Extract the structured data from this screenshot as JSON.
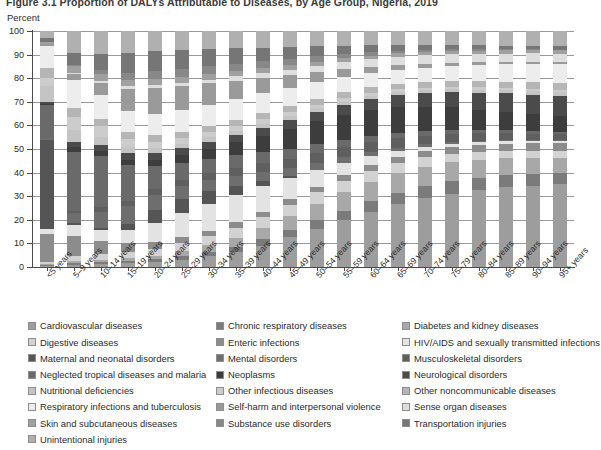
{
  "figure": {
    "title": "Figure 3.1  Proportion of DALYs Attributable to Diseases, by Age Group, Nigeria, 2019",
    "y_unit": "Percent"
  },
  "chart_data": {
    "type": "bar",
    "stacked": true,
    "title": "Figure 3.1  Proportion of DALYs Attributable to Diseases, by Age Group, Nigeria, 2019",
    "xlabel": "",
    "ylabel": "Percent",
    "ylim": [
      0,
      100
    ],
    "yticks": [
      0,
      10,
      20,
      30,
      40,
      50,
      60,
      70,
      80,
      90,
      100
    ],
    "grid": true,
    "legend_position": "bottom",
    "categories": [
      "<5 years",
      "5–9 years",
      "10–14 years",
      "15–19 years",
      "20–24 years",
      "25–29 years",
      "30–34 years",
      "35–39 years",
      "40–44 years",
      "45–49 years",
      "50–54 years",
      "55–59 years",
      "60–64 years",
      "65–69 years",
      "70–74 years",
      "75–79 years",
      "80–84 years",
      "85–89 years",
      "90–94 years",
      "95+ years"
    ],
    "series": [
      {
        "name": "Cardiovascular diseases",
        "color": "#9d9d9d",
        "values": [
          0.6,
          0.8,
          1.0,
          1.3,
          1.8,
          2.6,
          3.8,
          5.4,
          7.6,
          10.5,
          13.8,
          17.4,
          21.0,
          24.5,
          27.5,
          30.0,
          32.0,
          33.5,
          34.5,
          35.0
        ]
      },
      {
        "name": "Chronic respiratory diseases",
        "color": "#7b7b7b",
        "values": [
          0.4,
          0.7,
          0.8,
          0.9,
          1.0,
          1.2,
          1.5,
          1.8,
          2.2,
          2.6,
          3.1,
          3.6,
          4.1,
          4.5,
          4.8,
          5.0,
          5.1,
          5.1,
          5.0,
          4.9
        ]
      },
      {
        "name": "Diabetes and kidney diseases",
        "color": "#a8a8a8",
        "values": [
          0.3,
          0.5,
          0.7,
          0.9,
          1.2,
          1.7,
          2.3,
          3.1,
          4.0,
          5.0,
          6.0,
          6.8,
          7.4,
          7.8,
          7.9,
          7.8,
          7.5,
          7.1,
          6.8,
          6.5
        ]
      },
      {
        "name": "Digestive diseases",
        "color": "#d2d2d2",
        "values": [
          1.0,
          1.6,
          1.9,
          2.1,
          2.4,
          2.8,
          3.2,
          3.6,
          3.9,
          4.1,
          4.2,
          4.2,
          4.1,
          3.9,
          3.7,
          3.5,
          3.3,
          3.1,
          3.0,
          2.9
        ]
      },
      {
        "name": "Enteric infections",
        "color": "#8c8c8c",
        "values": [
          11.5,
          7.0,
          4.5,
          3.0,
          2.4,
          2.1,
          2.0,
          1.9,
          1.9,
          1.9,
          2.0,
          2.1,
          2.2,
          2.3,
          2.4,
          2.6,
          2.8,
          3.0,
          3.1,
          3.2
        ]
      },
      {
        "name": "HIV/AIDS and sexually transmitted infections",
        "color": "#e3e3e3",
        "values": [
          2.2,
          3.5,
          3.8,
          4.5,
          6.5,
          8.5,
          9.5,
          9.8,
          9.0,
          7.5,
          6.0,
          4.6,
          3.4,
          2.5,
          1.9,
          1.5,
          1.2,
          1.0,
          0.9,
          0.8
        ]
      },
      {
        "name": "Maternal and neonatal disorders",
        "color": "#555555",
        "values": [
          38.0,
          1.0,
          0.6,
          2.0,
          4.5,
          5.0,
          4.4,
          3.2,
          1.8,
          0.7,
          0.2,
          0.1,
          0.0,
          0.0,
          0.0,
          0.0,
          0.0,
          0.0,
          0.0,
          0.0
        ]
      },
      {
        "name": "Mental disorders",
        "color": "#6e6e6e",
        "values": [
          0.5,
          3.2,
          5.5,
          6.0,
          5.2,
          4.5,
          4.0,
          3.6,
          3.2,
          2.8,
          2.4,
          2.0,
          1.6,
          1.3,
          1.0,
          0.8,
          0.7,
          0.6,
          0.5,
          0.5
        ]
      },
      {
        "name": "Musculoskeletal disorders",
        "color": "#5f5f5f",
        "values": [
          0.2,
          0.8,
          1.4,
          1.8,
          2.0,
          2.2,
          2.5,
          2.8,
          3.1,
          3.4,
          3.6,
          3.7,
          3.7,
          3.6,
          3.4,
          3.2,
          3.0,
          2.8,
          2.6,
          2.5
        ]
      },
      {
        "name": "Neglected tropical diseases and malaria",
        "color": "#6a6a6a",
        "values": [
          14.0,
          20.0,
          17.5,
          12.0,
          8.0,
          6.0,
          5.0,
          4.4,
          4.0,
          3.6,
          3.2,
          2.8,
          2.4,
          2.1,
          1.8,
          1.6,
          1.4,
          1.3,
          1.2,
          1.1
        ]
      },
      {
        "name": "Neoplasms",
        "color": "#3d3d3d",
        "values": [
          0.6,
          1.6,
          1.8,
          1.9,
          2.2,
          2.8,
          3.6,
          4.6,
          5.8,
          7.0,
          8.2,
          9.2,
          9.8,
          10.0,
          9.8,
          9.2,
          8.4,
          7.6,
          7.0,
          6.5
        ]
      },
      {
        "name": "Neurological disorders",
        "color": "#4b4b4b",
        "values": [
          0.8,
          1.6,
          2.0,
          2.2,
          2.3,
          2.4,
          2.5,
          2.7,
          2.9,
          3.2,
          3.5,
          3.9,
          4.3,
          4.8,
          5.4,
          6.2,
          7.0,
          7.8,
          8.4,
          8.8
        ]
      },
      {
        "name": "Nutritional deficiencies",
        "color": "#c4c4c4",
        "values": [
          6.5,
          4.0,
          2.6,
          2.0,
          1.8,
          1.6,
          1.5,
          1.4,
          1.3,
          1.2,
          1.2,
          1.1,
          1.1,
          1.1,
          1.1,
          1.2,
          1.3,
          1.4,
          1.5,
          1.6
        ]
      },
      {
        "name": "Other infectious diseases",
        "color": "#cccccc",
        "values": [
          3.5,
          4.5,
          3.6,
          2.8,
          2.3,
          2.0,
          1.8,
          1.7,
          1.6,
          1.5,
          1.4,
          1.3,
          1.2,
          1.2,
          1.1,
          1.1,
          1.1,
          1.0,
          1.0,
          1.0
        ]
      },
      {
        "name": "Other noncommunicable diseases",
        "color": "#b5b5b5",
        "values": [
          4.2,
          3.0,
          2.6,
          2.4,
          2.3,
          2.2,
          2.2,
          2.2,
          2.2,
          2.2,
          2.2,
          2.2,
          2.2,
          2.2,
          2.3,
          2.4,
          2.5,
          2.6,
          2.7,
          2.8
        ]
      },
      {
        "name": "Respiratory infections and tuberculosis",
        "color": "#ededed",
        "values": [
          9.5,
          9.5,
          8.0,
          7.0,
          7.2,
          7.5,
          7.6,
          7.4,
          7.0,
          6.5,
          6.0,
          5.6,
          5.4,
          5.4,
          5.6,
          6.0,
          6.6,
          7.2,
          7.8,
          8.2
        ]
      },
      {
        "name": "Self-harm and interpersonal violence",
        "color": "#9a9a9a",
        "values": [
          0.6,
          2.0,
          4.0,
          7.5,
          9.0,
          8.5,
          7.5,
          6.4,
          5.4,
          4.4,
          3.6,
          3.0,
          2.4,
          2.0,
          1.7,
          1.4,
          1.2,
          1.0,
          0.9,
          0.8
        ]
      },
      {
        "name": "Sense organ diseases",
        "color": "#dedede",
        "values": [
          0.2,
          0.6,
          0.9,
          1.0,
          1.1,
          1.2,
          1.3,
          1.5,
          1.7,
          2.0,
          2.3,
          2.6,
          2.9,
          3.2,
          3.4,
          3.5,
          3.6,
          3.6,
          3.6,
          3.5
        ]
      },
      {
        "name": "Skin and subcutaneous diseases",
        "color": "#a0a0a0",
        "values": [
          0.9,
          2.2,
          2.4,
          2.3,
          2.1,
          2.0,
          1.9,
          1.8,
          1.7,
          1.6,
          1.5,
          1.4,
          1.4,
          1.3,
          1.3,
          1.3,
          1.3,
          1.3,
          1.3,
          1.3
        ]
      },
      {
        "name": "Substance use disorders",
        "color": "#888888",
        "values": [
          0.1,
          0.4,
          1.1,
          2.2,
          2.8,
          3.0,
          2.9,
          2.7,
          2.5,
          2.2,
          1.9,
          1.6,
          1.3,
          1.1,
          0.9,
          0.7,
          0.6,
          0.5,
          0.4,
          0.4
        ]
      },
      {
        "name": "Transportation injuries",
        "color": "#767676",
        "values": [
          1.4,
          4.0,
          5.6,
          6.8,
          7.0,
          6.6,
          6.0,
          5.4,
          4.8,
          4.2,
          3.6,
          3.1,
          2.7,
          2.3,
          2.0,
          1.8,
          1.6,
          1.5,
          1.4,
          1.3
        ]
      },
      {
        "name": "Unintentional injuries",
        "color": "#b0b0b0",
        "values": [
          3.0,
          7.5,
          7.7,
          7.4,
          6.9,
          6.6,
          6.3,
          6.1,
          5.9,
          5.7,
          5.5,
          5.4,
          5.3,
          5.3,
          5.4,
          5.6,
          5.9,
          6.1,
          6.3,
          6.5
        ]
      }
    ]
  },
  "legend": {
    "columns": [
      [
        "Cardiovascular diseases",
        "Digestive diseases",
        "Maternal and neonatal disorders",
        "Neglected tropical diseases and malaria",
        "Nutritional deficiencies",
        "Respiratory infections and tuberculosis",
        "Skin and subcutaneous diseases",
        "Unintentional injuries"
      ],
      [
        "Chronic respiratory diseases",
        "Enteric infections",
        "Mental disorders",
        "Neoplasms",
        "Other infectious diseases",
        "Self-harm and interpersonal violence",
        "Substance use disorders"
      ],
      [
        "Diabetes and kidney diseases",
        "HIV/AIDS and sexually transmitted infections",
        "Musculoskeletal disorders",
        "Neurological disorders",
        "Other noncommunicable diseases",
        "Sense organ diseases",
        "Transportation injuries"
      ]
    ]
  }
}
